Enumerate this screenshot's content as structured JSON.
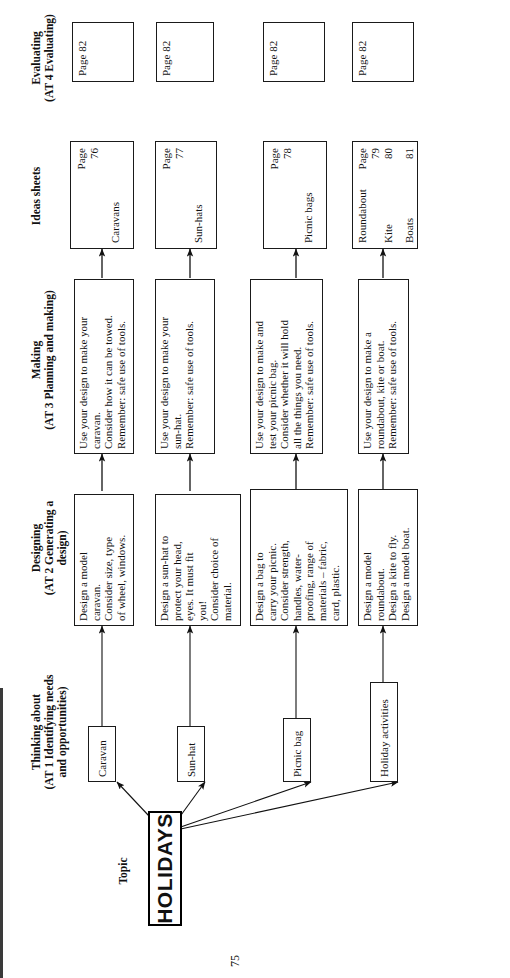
{
  "page": {
    "number": "75"
  },
  "columns": [
    {
      "id": "topic",
      "title": "Topic",
      "subtitle": ""
    },
    {
      "id": "thinking",
      "title": "Thinking about",
      "subtitle": "(AT 1 Identifying needs\nand opportunities)"
    },
    {
      "id": "designing",
      "title": "Designing",
      "subtitle": "(AT 2 Generating a\ndesign)"
    },
    {
      "id": "making",
      "title": "Making",
      "subtitle": "(AT 3 Planning and making)"
    },
    {
      "id": "ideas",
      "title": "Ideas sheets",
      "subtitle": ""
    },
    {
      "id": "evaluating",
      "title": "Evaluating",
      "subtitle": "(AT 4 Evaluating)"
    }
  ],
  "topic": {
    "label": "HOLIDAYS"
  },
  "thinking": [
    {
      "label": "Caravan"
    },
    {
      "label": "Sun-hat"
    },
    {
      "label": "Picnic bag"
    },
    {
      "label": "Holiday activities"
    }
  ],
  "designing": [
    {
      "lines": [
        "Design a model",
        "caravan.",
        "Consider size, type",
        "of wheel, windows."
      ]
    },
    {
      "lines": [
        "Design a sun-hat to",
        "protect your head,",
        "eyes. It must fit",
        "you!",
        "Consider choice of",
        "material."
      ]
    },
    {
      "lines": [
        "Design a bag to",
        "carry your picnic.",
        "Consider strength,",
        "handles, water-",
        "proofing, range of",
        "materials – fabric,",
        "card, plastic."
      ]
    },
    {
      "lines": [
        "Design a model",
        "roundabout.",
        "Design a kite to fly.",
        "Design a model boat."
      ]
    }
  ],
  "making": [
    {
      "lines": [
        "Use your design to make your",
        "caravan.",
        "Consider how it can be towed.",
        "Remember: safe use of tools."
      ]
    },
    {
      "lines": [
        "Use your design to make your",
        "sun-hat.",
        "Remember: safe use of tools."
      ]
    },
    {
      "lines": [
        "Use your design to make and",
        "test your picnic bag.",
        "Consider whether it will hold",
        "all the things you need.",
        "Remember: safe use of tools."
      ]
    },
    {
      "lines": [
        "Use your design to make a",
        "roundabout, kite or boat.",
        "Remember: safe use of tools."
      ]
    }
  ],
  "ideas_sheets": [
    {
      "entries": [
        {
          "label": "Caravans",
          "page": "76"
        }
      ],
      "page_word": "Page"
    },
    {
      "entries": [
        {
          "label": "Sun-hats",
          "page": "77"
        }
      ],
      "page_word": "Page"
    },
    {
      "entries": [
        {
          "label": "Picnic bags",
          "page": "78"
        }
      ],
      "page_word": "Page"
    },
    {
      "entries": [
        {
          "label": "Roundabout",
          "page": "79"
        },
        {
          "label": "Kite",
          "page": "80"
        },
        {
          "label": "Boats",
          "page": "81"
        }
      ],
      "page_word": "Page"
    }
  ],
  "evaluating": [
    {
      "label": "Page 82"
    },
    {
      "label": "Page 82"
    },
    {
      "label": "Page 82"
    },
    {
      "label": "Page 82"
    }
  ]
}
